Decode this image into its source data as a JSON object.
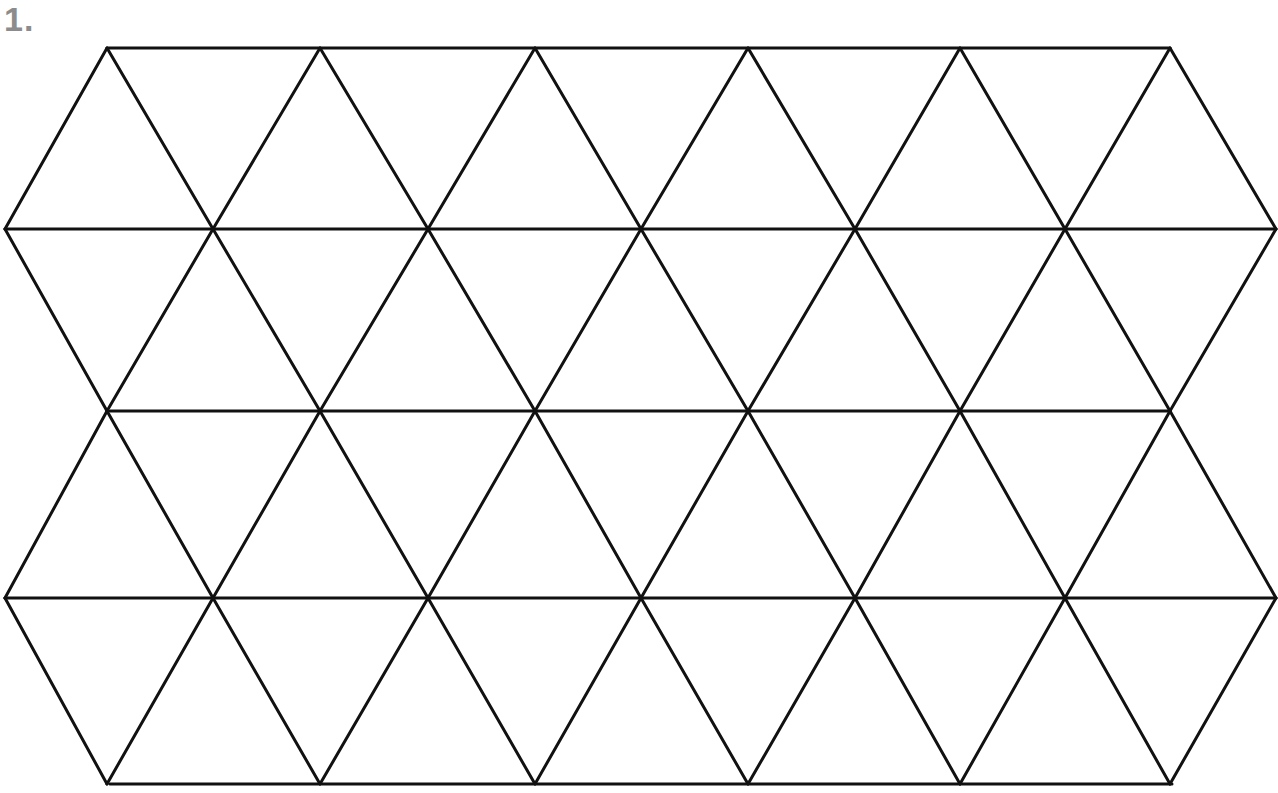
{
  "page": {
    "background_color": "#ffffff",
    "width": 1278,
    "height": 793
  },
  "item_number": {
    "label": "1.",
    "color": "#8c8c8c"
  },
  "figure": {
    "name": "triangular-tessellation-grid",
    "stroke_color": "#111111",
    "stroke_width": 3,
    "fill": "none",
    "rows": 4,
    "columns": 6,
    "triangle_side": 215,
    "row_height": 182,
    "geometry": {
      "row_y": [
        48,
        229,
        411,
        598,
        784
      ],
      "apex_x_even": [
        107,
        320,
        535,
        748,
        960,
        1170
      ],
      "apex_x_odd": [
        5,
        213,
        428,
        641,
        855,
        1065,
        1276
      ],
      "left_boundary_x": [
        107,
        5,
        110,
        5,
        110
      ],
      "right_boundary_x": [
        1170,
        1276,
        1170,
        1276,
        1172
      ]
    },
    "horizontal_lines": [
      {
        "name": "top-edge",
        "y": 48,
        "x1": 107,
        "x2": 1170
      },
      {
        "name": "row-1-baseline",
        "y": 229,
        "x1": 5,
        "x2": 1276
      },
      {
        "name": "row-2-baseline",
        "y": 411,
        "x1": 110,
        "x2": 1170
      },
      {
        "name": "row-3-baseline",
        "y": 598,
        "x1": 5,
        "x2": 1276
      },
      {
        "name": "bottom-edge",
        "y": 784,
        "x1": 110,
        "x2": 1172
      }
    ],
    "diagonal_count": 48,
    "triangle_count": 42
  }
}
